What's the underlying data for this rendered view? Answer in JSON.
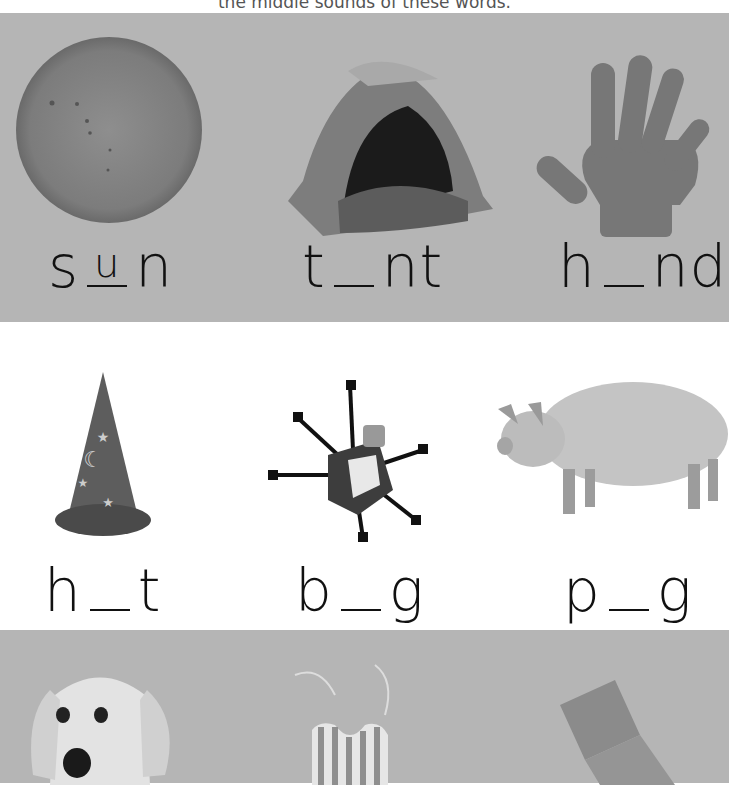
{
  "header": {
    "instruction": "the middle sounds of these words."
  },
  "rows": [
    {
      "items": [
        {
          "picture": "sun",
          "word_start": "s",
          "blank": "u",
          "word_end": "n"
        },
        {
          "picture": "tent",
          "word_start": "t",
          "blank": "",
          "word_end": "nt"
        },
        {
          "picture": "hand",
          "word_start": "h",
          "blank": "",
          "word_end": "nd"
        }
      ]
    },
    {
      "items": [
        {
          "picture": "hat",
          "word_start": "h",
          "blank": "",
          "word_end": "t"
        },
        {
          "picture": "bug",
          "word_start": "b",
          "blank": "",
          "word_end": "g"
        },
        {
          "picture": "pig",
          "word_start": "p",
          "blank": "",
          "word_end": "g"
        }
      ]
    },
    {
      "items": [
        {
          "picture": "dog"
        },
        {
          "picture": "bib"
        },
        {
          "picture": "sock"
        }
      ]
    }
  ],
  "colors": {
    "gray_band": "#b5b5b5",
    "white_band": "#ffffff",
    "text": "#111111"
  }
}
